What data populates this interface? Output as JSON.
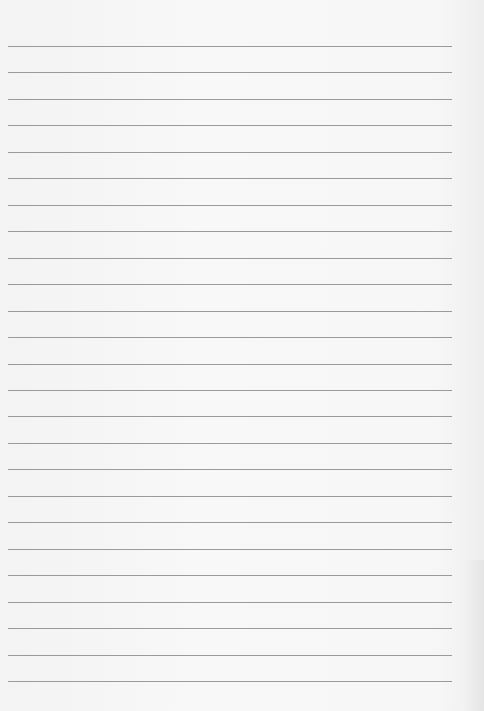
{
  "document": {
    "type": "lined-paper",
    "ruled_line_count": 25,
    "line_color": "#8a8a8a",
    "paper_color": "#f6f6f6",
    "text_content": []
  }
}
